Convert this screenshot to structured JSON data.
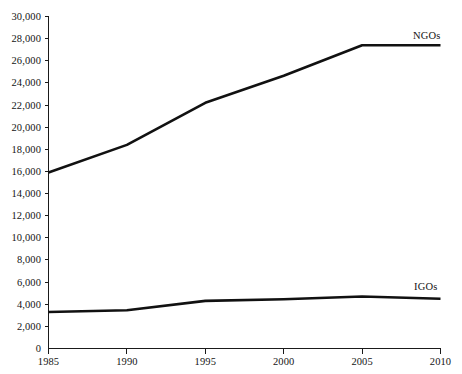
{
  "chart_data": {
    "type": "line",
    "title": "",
    "subtitle": "",
    "xlabel": "",
    "ylabel": "",
    "x": [
      1985,
      1990,
      1995,
      2000,
      2005,
      2010
    ],
    "xlim": [
      1985,
      2010
    ],
    "ylim": [
      0,
      30000
    ],
    "grid": false,
    "legend_position": "inline-right-of-series",
    "x_tick_labels": [
      "1985",
      "1990",
      "1995",
      "2000",
      "2005",
      "2010"
    ],
    "y_tick_labels": [
      "0",
      "2,000",
      "4,000",
      "6,000",
      "8,000",
      "10,000",
      "12,000",
      "14,000",
      "16,000",
      "18,000",
      "20,000",
      "22,000",
      "24,000",
      "26,000",
      "28,000",
      "30,000"
    ],
    "y_tick_values": [
      0,
      2000,
      4000,
      6000,
      8000,
      10000,
      12000,
      14000,
      16000,
      18000,
      20000,
      22000,
      24000,
      26000,
      28000,
      30000
    ],
    "series": [
      {
        "name": "NGOs",
        "label": "NGOs",
        "color": "#111111",
        "values": [
          15900,
          18400,
          22200,
          24650,
          27400,
          27400
        ]
      },
      {
        "name": "IGOs",
        "label": "IGOs",
        "color": "#111111",
        "values": [
          3300,
          3450,
          4300,
          4450,
          4700,
          4500
        ]
      }
    ],
    "annotations": [
      {
        "text": "NGOs",
        "x": 2008,
        "y": 28200
      },
      {
        "text": "IGOs",
        "x": 2008,
        "y": 5400
      }
    ]
  },
  "axes": {
    "origin_label": "0",
    "y_axis_name": "value-axis",
    "x_axis_name": "year-axis"
  }
}
